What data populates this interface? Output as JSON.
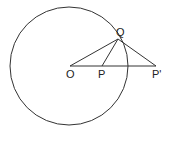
{
  "diagram": {
    "type": "geometry",
    "circle": {
      "center_label": "O",
      "cx": 69,
      "cy": 66,
      "r": 59
    },
    "points": [
      {
        "label": "O",
        "x": 70,
        "y": 66
      },
      {
        "label": "P",
        "x": 102,
        "y": 66
      },
      {
        "label": "P'",
        "x": 156,
        "y": 66
      },
      {
        "label": "Q",
        "x": 118,
        "y": 39
      }
    ],
    "segments": [
      [
        "O",
        "P'"
      ],
      [
        "O",
        "Q"
      ],
      [
        "P",
        "Q"
      ],
      [
        "Q",
        "P'"
      ]
    ],
    "colors": {
      "stroke": "#333333",
      "background": "#ffffff"
    }
  }
}
